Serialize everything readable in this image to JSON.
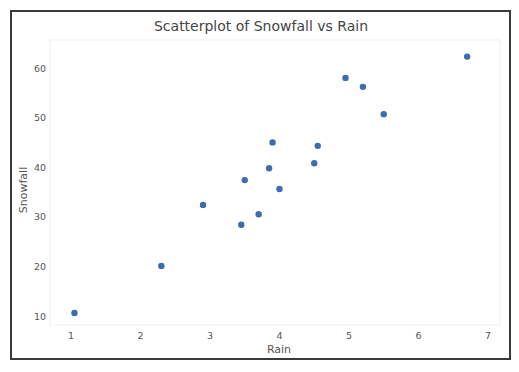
{
  "chart_data": {
    "type": "scatter",
    "title": "Scatterplot of Snowfall vs Rain",
    "xlabel": "Rain",
    "ylabel": "Snowfall",
    "xlim": [
      0.7,
      7.15
    ],
    "ylim": [
      7.5,
      65
    ],
    "xticks": [
      1,
      2,
      3,
      4,
      5,
      6,
      7
    ],
    "yticks": [
      10,
      20,
      30,
      40,
      50,
      60
    ],
    "grid": false,
    "legend": null,
    "marker_color": "#3d6cb0",
    "series": [
      {
        "name": "Snowfall vs Rain",
        "points": [
          {
            "x": 1.05,
            "y": 10.6
          },
          {
            "x": 2.3,
            "y": 20.1
          },
          {
            "x": 2.9,
            "y": 32.4
          },
          {
            "x": 3.45,
            "y": 28.4
          },
          {
            "x": 3.5,
            "y": 37.4
          },
          {
            "x": 3.7,
            "y": 30.5
          },
          {
            "x": 3.85,
            "y": 39.8
          },
          {
            "x": 3.9,
            "y": 45.0
          },
          {
            "x": 4.0,
            "y": 35.6
          },
          {
            "x": 4.5,
            "y": 40.8
          },
          {
            "x": 4.55,
            "y": 44.3
          },
          {
            "x": 4.95,
            "y": 58.0
          },
          {
            "x": 5.2,
            "y": 56.2
          },
          {
            "x": 5.5,
            "y": 50.7
          },
          {
            "x": 6.7,
            "y": 62.3
          }
        ]
      }
    ]
  }
}
